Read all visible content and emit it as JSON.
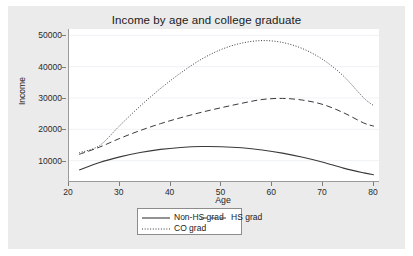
{
  "chart_data": {
    "type": "line",
    "title": "Income by age and college graduate",
    "xlabel": "Age",
    "ylabel": "Income",
    "xlim": [
      20,
      81
    ],
    "ylim": [
      3500,
      52000
    ],
    "xticks": [
      20,
      30,
      40,
      50,
      60,
      70,
      80
    ],
    "yticks": [
      10000,
      20000,
      30000,
      40000,
      50000
    ],
    "grid": "horizontal",
    "legend_position": "bottom-center",
    "x": [
      22,
      26,
      30,
      34,
      38,
      42,
      46,
      50,
      54,
      58,
      62,
      66,
      70,
      74,
      78,
      80
    ],
    "series": [
      {
        "name": "Non-HS grad",
        "style": "solid",
        "values": [
          7000,
          9400,
          11200,
          12600,
          13600,
          14200,
          14500,
          14450,
          14100,
          13400,
          12400,
          11100,
          9500,
          7600,
          6100,
          5500
        ]
      },
      {
        "name": "HS grad",
        "style": "dashed",
        "values": [
          12000,
          14300,
          17100,
          19600,
          21800,
          23700,
          25400,
          26900,
          28300,
          29500,
          29850,
          29300,
          27900,
          25300,
          22000,
          21000
        ]
      },
      {
        "name": "CO grad",
        "style": "dotted",
        "values": [
          12500,
          14800,
          21200,
          27400,
          33000,
          38000,
          42300,
          45500,
          47500,
          48300,
          47700,
          45700,
          42200,
          37000,
          30000,
          27500
        ]
      }
    ]
  },
  "legend": {
    "entries": [
      {
        "label": "Non-HS grad",
        "style": "solid"
      },
      {
        "label": "HS grad",
        "style": "dashed"
      },
      {
        "label": "CO grad",
        "style": "dotted"
      }
    ]
  },
  "colors": {
    "line": "#3a3a3a",
    "graph_background": "#ebebeb",
    "plot_background": "#ffffff",
    "gridline": "#eff2f5",
    "axis": "#9a9a9a"
  }
}
